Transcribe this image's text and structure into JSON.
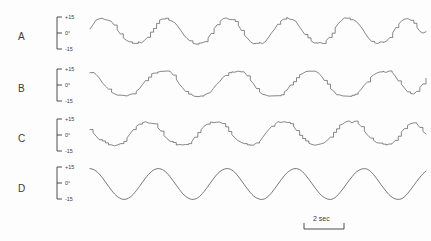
{
  "figure": {
    "background_color": "#fdfdfd",
    "trace_color": "#555555",
    "text_color": "#3a3a3a"
  },
  "scale_bar": {
    "label": "2 sec",
    "name": "time-scale-bar"
  },
  "axis": {
    "tick_top": "+15",
    "tick_mid": "0°",
    "tick_bottom": "-15"
  },
  "rows": [
    {
      "label": "A",
      "trace_id": "trace-a"
    },
    {
      "label": "B",
      "trace_id": "trace-b"
    },
    {
      "label": "C",
      "trace_id": "trace-c"
    },
    {
      "label": "D",
      "trace_id": "trace-d"
    }
  ],
  "chart_data": {
    "type": "line",
    "title": "",
    "xlabel": "",
    "ylabel": "",
    "ylim": [
      -15,
      15
    ],
    "grid": false,
    "legend": "none",
    "x_scale_bar_seconds": 2,
    "y_tick_labels": [
      "+15",
      "0°",
      "-15"
    ],
    "y_ticks": [
      15,
      0,
      -15
    ],
    "series": [
      {
        "name": "A",
        "style": "stepped-quasi-sinusoid",
        "cycles": 6,
        "amplitude": 11,
        "values": [
          2,
          6,
          9,
          10.5,
          10.5,
          9.5,
          9.8,
          8.5,
          5.5,
          2.0,
          -1.5,
          -4.5,
          -6.5,
          -8.0,
          -8.6,
          -9.0,
          -8.2,
          -8.6,
          -7.0,
          -4.0,
          -0.5,
          3.0,
          6.5,
          9.0,
          10.6,
          11.0,
          10.0,
          9.0,
          7.5,
          4.5,
          1.0,
          -2.5,
          -5.5,
          -7.5,
          -9.0,
          -9.3,
          -8.8,
          -9.1,
          -7.5,
          -4.5,
          -1.0,
          2.5,
          6.0,
          8.8,
          10.4,
          10.8,
          9.6,
          9.9,
          8.0,
          5.0,
          1.5,
          -2.0,
          -5.0,
          -7.2,
          -8.6,
          -9.2,
          -8.5,
          -8.9,
          -7.2,
          -4.2,
          -0.8,
          2.8,
          6.2,
          9.0,
          10.5,
          10.9,
          9.8,
          10.1,
          8.2,
          5.2,
          1.8,
          -1.8,
          -4.8,
          -7.0,
          -8.4,
          -9.0,
          -8.3,
          -8.7,
          -7.0,
          -4.0,
          -0.5,
          3.0,
          6.4,
          9.1,
          10.6,
          11.0,
          9.9,
          10.2,
          8.3,
          5.3,
          1.9,
          -1.7,
          -4.7,
          -6.9,
          -8.3,
          -8.9,
          -8.2,
          -8.6,
          -6.9,
          -3.9,
          -0.4,
          3.1,
          6.5,
          9.2,
          10.7,
          10.4,
          9.0,
          7.0,
          4.0,
          1.0,
          -1.0,
          0.5
        ]
      },
      {
        "name": "B",
        "style": "flat-topped-staircase",
        "cycles": 6,
        "amplitude": 11,
        "values": [
          8.5,
          9.0,
          8.0,
          5.0,
          1.5,
          -1.5,
          -4.0,
          -6.0,
          -7.5,
          -8.5,
          -9.0,
          -9.2,
          -9.0,
          -8.5,
          -7.5,
          -6.0,
          -3.5,
          -0.5,
          2.5,
          5.5,
          7.5,
          9.0,
          9.8,
          10.0,
          9.8,
          10.0,
          9.5,
          7.0,
          3.5,
          0.0,
          -3.0,
          -5.5,
          -7.5,
          -8.8,
          -9.4,
          -9.6,
          -9.4,
          -9.0,
          -8.0,
          -6.5,
          -4.0,
          -1.0,
          2.0,
          5.0,
          7.2,
          8.8,
          9.6,
          9.9,
          9.7,
          9.9,
          9.4,
          6.8,
          3.2,
          -0.3,
          -3.3,
          -5.8,
          -7.8,
          -9.0,
          -9.5,
          -9.7,
          -9.5,
          -9.1,
          -8.1,
          -6.6,
          -4.1,
          -1.1,
          1.9,
          4.9,
          7.1,
          8.7,
          9.5,
          9.8,
          9.6,
          9.8,
          9.3,
          6.7,
          3.1,
          -0.4,
          -3.4,
          -5.9,
          -7.9,
          -9.1,
          -9.6,
          -9.8,
          -9.6,
          -9.2,
          -8.2,
          -6.7,
          -4.2,
          -1.2,
          1.8,
          4.8,
          7.0,
          8.6,
          9.4,
          9.7,
          9.5,
          9.7,
          9.2,
          6.6,
          3.0,
          -0.5,
          -3.5,
          -6.0,
          -8.0,
          -8.0,
          -6.0,
          -3.0,
          0.5,
          4.0
        ]
      },
      {
        "name": "C",
        "style": "angular-stepped",
        "cycles": 6,
        "amplitude": 10,
        "values": [
          3.0,
          1.0,
          -1.5,
          -4.0,
          -6.0,
          -7.5,
          -8.5,
          -9.0,
          -9.2,
          -8.8,
          -8.0,
          -6.0,
          -3.0,
          0.5,
          3.5,
          6.0,
          7.8,
          8.8,
          9.2,
          8.8,
          9.0,
          8.0,
          5.5,
          2.0,
          -1.0,
          -3.5,
          -5.5,
          -7.2,
          -8.2,
          -8.8,
          -9.0,
          -8.6,
          -7.8,
          -5.8,
          -2.8,
          0.7,
          3.7,
          6.2,
          8.0,
          9.0,
          9.4,
          9.0,
          9.2,
          8.2,
          5.7,
          2.2,
          -0.8,
          -3.3,
          -5.3,
          -7.0,
          -8.0,
          -8.6,
          -8.8,
          -8.4,
          -7.6,
          -5.6,
          -2.6,
          0.9,
          3.9,
          6.4,
          8.2,
          9.2,
          9.6,
          9.2,
          9.4,
          8.4,
          5.9,
          2.4,
          -0.6,
          -3.1,
          -5.1,
          -6.8,
          -7.8,
          -8.4,
          -8.6,
          -8.2,
          -7.4,
          -5.4,
          -2.4,
          1.1,
          4.1,
          6.6,
          8.4,
          9.4,
          9.8,
          9.4,
          9.6,
          8.6,
          6.1,
          2.6,
          -0.4,
          -2.9,
          -4.9,
          -6.6,
          -7.6,
          -8.2,
          -8.4,
          -8.0,
          -7.2,
          -5.2,
          -2.2,
          1.3,
          4.3,
          6.8,
          8.6,
          9.0,
          8.0,
          5.0,
          2.0,
          -0.5
        ]
      },
      {
        "name": "D",
        "style": "smooth-sinusoid",
        "cycles": 6,
        "amplitude": 11,
        "values": [
          11.0,
          10.5,
          9.2,
          7.1,
          4.5,
          1.5,
          -1.6,
          -4.6,
          -7.2,
          -9.2,
          -10.5,
          -11.0,
          -10.6,
          -9.4,
          -7.4,
          -4.8,
          -1.9,
          1.2,
          4.2,
          6.9,
          9.0,
          10.4,
          11.0,
          10.7,
          9.6,
          7.7,
          5.1,
          2.2,
          -0.9,
          -3.9,
          -6.7,
          -8.8,
          -10.2,
          -11.0,
          -10.8,
          -9.8,
          -7.9,
          -5.4,
          -2.5,
          0.6,
          3.6,
          6.4,
          8.6,
          10.1,
          10.9,
          10.9,
          10.0,
          8.2,
          5.7,
          2.8,
          -0.3,
          -3.3,
          -6.1,
          -8.4,
          -9.9,
          -10.8,
          -11.0,
          -10.2,
          -8.4,
          -6.0,
          -3.1,
          0.0,
          3.0,
          5.8,
          8.2,
          9.8,
          10.8,
          11.0,
          10.3,
          8.6,
          6.2,
          3.4,
          0.3,
          -2.7,
          -5.5,
          -8.0,
          -9.6,
          -10.7,
          -11.0,
          -10.4,
          -8.8,
          -6.4,
          -3.6,
          -0.6,
          2.4,
          5.2,
          7.8,
          9.5,
          10.6,
          11.0,
          10.5,
          9.0,
          6.7,
          3.9,
          0.8,
          -2.2,
          -5.0,
          -7.6,
          -9.4,
          -10.6,
          -11.0,
          -10.6,
          -9.2,
          -6.9,
          -4.1,
          -1.1,
          1.9,
          4.7,
          7.3,
          9.2
        ]
      }
    ]
  }
}
